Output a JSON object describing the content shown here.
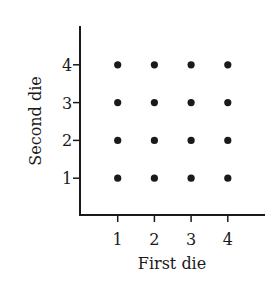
{
  "chart_data": {
    "type": "scatter",
    "title": "",
    "xlabel": "First die",
    "ylabel": "Second die",
    "x_ticks": [
      "1",
      "2",
      "3",
      "4"
    ],
    "y_ticks": [
      "1",
      "2",
      "3",
      "4"
    ],
    "xlim": [
      0,
      4.8
    ],
    "ylim": [
      0,
      4.8
    ],
    "grid": false,
    "legend": null,
    "points": [
      {
        "x": 1,
        "y": 1
      },
      {
        "x": 2,
        "y": 1
      },
      {
        "x": 3,
        "y": 1
      },
      {
        "x": 4,
        "y": 1
      },
      {
        "x": 1,
        "y": 2
      },
      {
        "x": 2,
        "y": 2
      },
      {
        "x": 3,
        "y": 2
      },
      {
        "x": 4,
        "y": 2
      },
      {
        "x": 1,
        "y": 3
      },
      {
        "x": 2,
        "y": 3
      },
      {
        "x": 3,
        "y": 3
      },
      {
        "x": 4,
        "y": 3
      },
      {
        "x": 1,
        "y": 4
      },
      {
        "x": 2,
        "y": 4
      },
      {
        "x": 3,
        "y": 4
      },
      {
        "x": 4,
        "y": 4
      }
    ],
    "point_color": "#1a1a1a"
  }
}
